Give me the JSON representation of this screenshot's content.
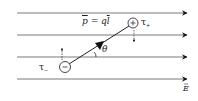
{
  "diagram": {
    "field_lines": [
      {
        "y": 13,
        "x1": 17,
        "x2": 185
      },
      {
        "y": 35,
        "x1": 17,
        "x2": 185
      },
      {
        "y": 57,
        "x1": 17,
        "x2": 185
      },
      {
        "y": 79,
        "x1": 17,
        "x2": 185
      }
    ],
    "field_label": "E",
    "dipole_moment_label": {
      "p": "p",
      "equals": " = ",
      "q": "q",
      "l": "l"
    },
    "angle_label": "θ",
    "positive_charge": {
      "symbol": "+",
      "x": 133,
      "y": 23,
      "torque_label": "τ",
      "torque_sub": "+"
    },
    "negative_charge": {
      "symbol": "−",
      "x": 65,
      "y": 67,
      "torque_label": "τ",
      "torque_sub": "−"
    },
    "colors": {
      "line": "#7a7a7a",
      "arrowhead": "#111111",
      "text": "#222222"
    }
  }
}
